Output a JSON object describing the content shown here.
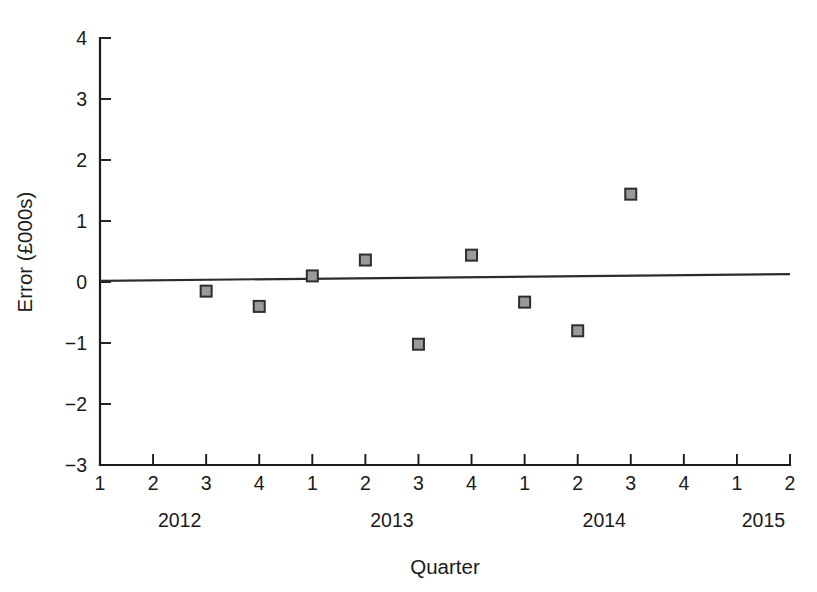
{
  "chart_data": {
    "type": "scatter",
    "title": "",
    "xlabel": "Quarter",
    "ylabel": "Error (£000s)",
    "ylim": [
      -3,
      4
    ],
    "yticks": [
      -3,
      -2,
      -1,
      0,
      1,
      2,
      3,
      4
    ],
    "ytick_labels": [
      "−3",
      "−2",
      "−1",
      "0",
      "1",
      "2",
      "3",
      "4"
    ],
    "grid": false,
    "legend": null,
    "x_categories": [
      "1",
      "2",
      "3",
      "4",
      "1",
      "2",
      "3",
      "4",
      "1",
      "2",
      "3",
      "4",
      "1",
      "2"
    ],
    "x_group_labels": [
      "2012",
      "2013",
      "2014",
      "2015"
    ],
    "x_group_centers": [
      1.5,
      5.5,
      9.5,
      12.5
    ],
    "points": [
      {
        "x_index": 2,
        "quarter": "3",
        "year": "2012",
        "value": -0.15
      },
      {
        "x_index": 3,
        "quarter": "4",
        "year": "2012",
        "value": -0.4
      },
      {
        "x_index": 4,
        "quarter": "1",
        "year": "2013",
        "value": 0.1
      },
      {
        "x_index": 5,
        "quarter": "2",
        "year": "2013",
        "value": 0.36
      },
      {
        "x_index": 6,
        "quarter": "3",
        "year": "2013",
        "value": -1.02
      },
      {
        "x_index": 7,
        "quarter": "4",
        "year": "2013",
        "value": 0.44
      },
      {
        "x_index": 8,
        "quarter": "1",
        "year": "2014",
        "value": -0.33
      },
      {
        "x_index": 9,
        "quarter": "2",
        "year": "2014",
        "value": -0.8
      },
      {
        "x_index": 10,
        "quarter": "3",
        "year": "2014",
        "value": 1.44
      }
    ],
    "trend_line": {
      "x_start_index": 0,
      "x_end_index": 13,
      "y_start": 0.02,
      "y_end": 0.13
    },
    "marker": {
      "shape": "square",
      "fill_color": "#9a9a9a",
      "edge_color": "#2e2e2e",
      "size_px": 11
    },
    "axis_color": "#1a1a1a",
    "background_color": "#ffffff"
  },
  "axes": {
    "y_title": "Error (£000s)",
    "x_title": "Quarter"
  }
}
